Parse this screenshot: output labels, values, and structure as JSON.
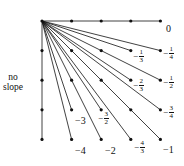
{
  "diagram": {
    "title": "",
    "origin": {
      "col": 0,
      "row": 0
    },
    "grid": {
      "cols": 5,
      "rows": 5,
      "x0": 42,
      "y0": 21,
      "spacing": 29.6
    },
    "stroke_color": "#111111",
    "no_slope_label": [
      "no",
      "slope"
    ],
    "lines": [
      {
        "to": [
          4,
          0
        ],
        "slope": "0"
      },
      {
        "to": [
          4,
          1
        ],
        "slope": "-1/4"
      },
      {
        "to": [
          3,
          1
        ],
        "slope": "-1/3"
      },
      {
        "to": [
          3,
          2
        ],
        "slope": "-2/3"
      },
      {
        "to": [
          4,
          2
        ],
        "slope": "-1/2"
      },
      {
        "to": [
          4,
          3
        ],
        "slope": "-3/4"
      },
      {
        "to": [
          4,
          4
        ],
        "slope": "-1"
      },
      {
        "to": [
          3,
          4
        ],
        "slope": "-4/3"
      },
      {
        "to": [
          2,
          4
        ],
        "slope": "-2"
      },
      {
        "to": [
          2,
          3
        ],
        "slope": "-3/2"
      },
      {
        "to": [
          1,
          4
        ],
        "slope": "-4"
      },
      {
        "to": [
          1,
          3
        ],
        "slope": "-3"
      },
      {
        "to": [
          0,
          4
        ],
        "slope": "no slope"
      }
    ],
    "labels": {
      "zero": "0",
      "neg_one": "−1",
      "neg_two": "−2",
      "neg_three": "−3",
      "neg_four": "−4",
      "neg_sign": "−",
      "f_1_4": {
        "num": "1",
        "den": "4"
      },
      "f_1_3": {
        "num": "1",
        "den": "3"
      },
      "f_2_3": {
        "num": "2",
        "den": "3"
      },
      "f_1_2": {
        "num": "1",
        "den": "2"
      },
      "f_3_4": {
        "num": "3",
        "den": "4"
      },
      "f_4_3": {
        "num": "4",
        "den": "3"
      },
      "f_3_2": {
        "num": "3",
        "den": "2"
      }
    }
  }
}
